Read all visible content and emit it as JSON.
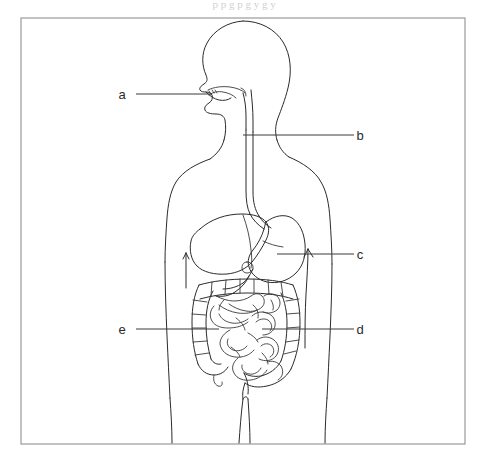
{
  "figure": {
    "background_color": "#ffffff",
    "line_color": "#2b2b2b",
    "frame_color": "#9a9a9a",
    "frame": {
      "x": 21,
      "y": 18,
      "width": 444,
      "height": 426
    }
  },
  "labels": [
    {
      "id": "a",
      "text": "a",
      "text_x": 122,
      "text_y": 99,
      "leader": {
        "x1": 136,
        "y1": 94,
        "x2": 212,
        "y2": 94
      },
      "target": "mouth"
    },
    {
      "id": "b",
      "text": "b",
      "text_x": 360,
      "text_y": 140,
      "leader": {
        "x1": 243,
        "y1": 135,
        "x2": 354,
        "y2": 135
      },
      "target": "esophagus"
    },
    {
      "id": "c",
      "text": "c",
      "text_x": 360,
      "text_y": 259,
      "leader": {
        "x1": 277,
        "y1": 254,
        "x2": 354,
        "y2": 254
      },
      "target": "stomach"
    },
    {
      "id": "d",
      "text": "d",
      "text_x": 360,
      "text_y": 334,
      "leader": {
        "x1": 262,
        "y1": 329,
        "x2": 354,
        "y2": 329
      },
      "target": "small-intestine"
    },
    {
      "id": "e",
      "text": "e",
      "text_x": 122,
      "text_y": 334,
      "leader": {
        "x1": 136,
        "y1": 329,
        "x2": 219,
        "y2": 329
      },
      "target": "large-intestine"
    }
  ],
  "scan_artifacts": {
    "top_row": "p      p      g         p        g        y     g                    y"
  }
}
